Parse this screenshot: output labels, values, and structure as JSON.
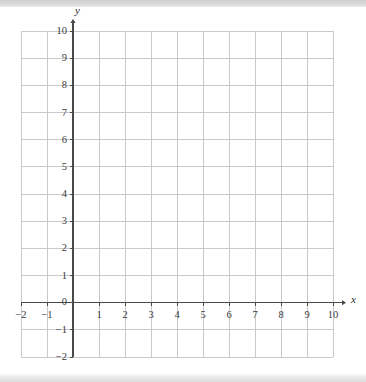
{
  "page": {
    "width": 366,
    "height": 382,
    "background": "#ffffff",
    "scan_band_top_color": "#d4d4d4",
    "scan_band_bottom_color": "#e2e2e2"
  },
  "chart_data": {
    "type": "scatter",
    "title": "",
    "subtitle": "",
    "xlabel": "x",
    "ylabel": "y",
    "xlim": [
      -2,
      10
    ],
    "ylim": [
      -2,
      10
    ],
    "xticks": [
      -2,
      -1,
      0,
      1,
      2,
      3,
      4,
      5,
      6,
      7,
      8,
      9,
      10
    ],
    "yticks": [
      -2,
      -1,
      0,
      1,
      2,
      3,
      4,
      5,
      6,
      7,
      8,
      9,
      10
    ],
    "xtick_labels": [
      "-2",
      "-1",
      "0",
      "1",
      "2",
      "3",
      "4",
      "5",
      "6",
      "7",
      "8",
      "9",
      "10"
    ],
    "ytick_labels": [
      "-2",
      "-1",
      "0",
      "1",
      "2",
      "3",
      "4",
      "5",
      "6",
      "7",
      "8",
      "9",
      "10"
    ],
    "grid": true,
    "grid_step": 1,
    "legend": false,
    "legend_position": "none",
    "series": [],
    "annotations": []
  },
  "axes": {
    "x_axis_label": "x",
    "y_axis_label": "y",
    "zero_label": "0",
    "x_arrow": true,
    "y_arrow": true,
    "axis_color": "#4a4a4a",
    "grid_color": "#c9c9c9",
    "tick_text_color": "#3b3b3b"
  },
  "geometry": {
    "left_px": 21,
    "right_px": 333,
    "top_px": 31,
    "bottom_px": 357,
    "origin_x_px": 78,
    "origin_y_px": 300,
    "cell_w_px": 26,
    "cell_h_px": 27.17
  }
}
